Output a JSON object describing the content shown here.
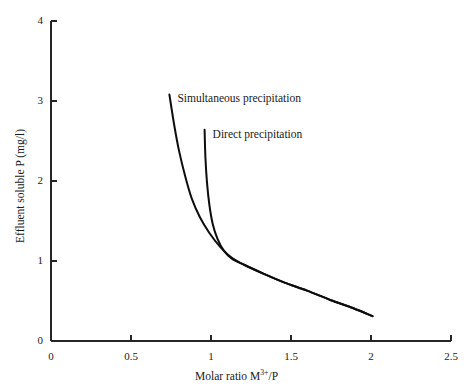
{
  "chart_data": {
    "type": "line",
    "title": "",
    "xlabel": "Molar ratio M3+/P",
    "xlabel_parts": {
      "prefix": "Molar ratio M",
      "sup": "3+",
      "suffix": "/P"
    },
    "ylabel": "Effluent soluble P (mg/l)",
    "xlim": [
      0,
      2.5
    ],
    "ylim": [
      0,
      4
    ],
    "xticks": [
      "0",
      "0.5",
      "1",
      "1.5",
      "2",
      "2.5"
    ],
    "xtick_values": [
      0,
      0.5,
      1,
      1.5,
      2,
      2.5
    ],
    "yticks": [
      "0",
      "1",
      "2",
      "3",
      "4"
    ],
    "ytick_values": [
      0,
      1,
      2,
      3,
      4
    ],
    "grid": false,
    "legend_position": "inline-annotations",
    "line_color": "#0d0d0d",
    "axis_color": "#262626",
    "series": [
      {
        "name": "Simultaneous precipitation",
        "label_x": 0.79,
        "label_y": 3.02,
        "points": [
          [
            0.74,
            3.08
          ],
          [
            0.77,
            2.7
          ],
          [
            0.8,
            2.38
          ],
          [
            0.84,
            2.05
          ],
          [
            0.88,
            1.78
          ],
          [
            0.93,
            1.55
          ],
          [
            0.99,
            1.35
          ],
          [
            1.06,
            1.17
          ],
          [
            1.13,
            1.04
          ],
          [
            1.21,
            0.95
          ],
          [
            1.33,
            0.84
          ],
          [
            1.46,
            0.73
          ],
          [
            1.6,
            0.63
          ],
          [
            1.75,
            0.51
          ],
          [
            1.89,
            0.41
          ],
          [
            2.01,
            0.31
          ]
        ]
      },
      {
        "name": "Direct precipitation",
        "label_x": 1.01,
        "label_y": 2.58,
        "points": [
          [
            0.96,
            2.64
          ],
          [
            0.965,
            2.3
          ],
          [
            0.975,
            1.98
          ],
          [
            0.99,
            1.7
          ],
          [
            1.01,
            1.47
          ],
          [
            1.04,
            1.28
          ],
          [
            1.08,
            1.13
          ],
          [
            1.13,
            1.03
          ],
          [
            1.21,
            0.95
          ],
          [
            1.33,
            0.84
          ],
          [
            1.46,
            0.73
          ],
          [
            1.6,
            0.63
          ],
          [
            1.75,
            0.51
          ],
          [
            1.89,
            0.41
          ],
          [
            2.01,
            0.31
          ]
        ]
      }
    ],
    "annotations": [
      {
        "text": "Simultaneous precipitation",
        "x": 0.79,
        "y": 3.02
      },
      {
        "text": "Direct precipitation",
        "x": 1.01,
        "y": 2.58
      }
    ]
  }
}
